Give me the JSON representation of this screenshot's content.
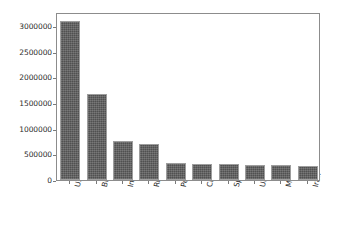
{
  "figure": {
    "background_color": "#ffffff",
    "width": 338,
    "height": 231
  },
  "chart_data": {
    "type": "bar",
    "title": "",
    "subtitle": "",
    "xlabel": "",
    "ylabel": "",
    "categories": [
      "USA",
      "Brazil",
      "India",
      "Russia",
      "Peru",
      "Chile",
      "Spain",
      "UK",
      "Mexico",
      "Iran"
    ],
    "values": [
      3100000,
      1675000,
      750000,
      700000,
      330000,
      315000,
      315000,
      300000,
      290000,
      270000
    ],
    "ylim": [
      0,
      3270000
    ],
    "ytick_labels": [
      "0",
      "500000",
      "1000000",
      "1500000",
      "2000000",
      "2500000",
      "3000000"
    ],
    "ytick_values": [
      0,
      500000,
      1000000,
      1500000,
      2000000,
      2500000,
      3000000
    ],
    "grid": false,
    "legend": null,
    "legend_position": "none",
    "bar_color": "#5a5a5a",
    "bar_edge_color": "#9e9e9e",
    "axis_color": "#8c8c8c",
    "tick_label_color": "#2b2b2b",
    "xtick_label_rotation": -78,
    "annotations": []
  }
}
